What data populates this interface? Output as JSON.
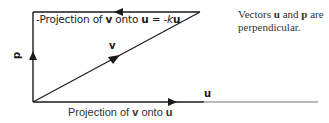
{
  "diagram": {
    "type": "vector-projection",
    "colors": {
      "line": "#1a1a1a",
      "background": "#ffffff"
    },
    "top_caption": {
      "prefix": "-Projection of ",
      "v": "v",
      "mid": " onto ",
      "u": "u",
      "eq": " = -",
      "k": "k",
      "u2": "u"
    },
    "bottom_caption": {
      "prefix": "Projection of ",
      "v": "v",
      "mid": " onto ",
      "u": "u"
    },
    "note": {
      "prefix": "Vectors ",
      "u": "u",
      "mid": " and ",
      "p": "p",
      "suffix": " are perpendicular."
    },
    "vector_labels": {
      "v": "v",
      "u": "u",
      "p": "p"
    },
    "vectors": [
      {
        "name": "u",
        "from": [
          33,
          102
        ],
        "to": [
          318,
          102
        ]
      },
      {
        "name": "p",
        "from": [
          33,
          102
        ],
        "to": [
          33,
          12
        ]
      },
      {
        "name": "v",
        "from": [
          33,
          102
        ],
        "to": [
          200,
          12
        ]
      },
      {
        "name": "-ku",
        "from": [
          200,
          12
        ],
        "to": [
          33,
          12
        ]
      }
    ]
  }
}
